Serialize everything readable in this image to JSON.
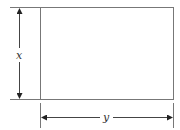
{
  "diagram": {
    "type": "rectangle-dimensions",
    "labels": {
      "height": "x",
      "width": "y"
    },
    "colors": {
      "stroke": "#666666",
      "arrow": "#222222",
      "text": "#333333"
    }
  }
}
